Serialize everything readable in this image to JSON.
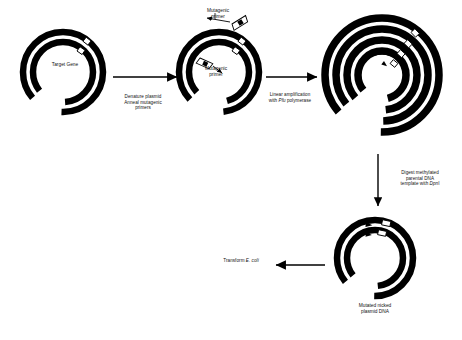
{
  "diagram": {
    "background_color": "#ffffff",
    "ink_color": "#000000",
    "width": 462,
    "height": 340
  },
  "steps": {
    "denature": "Denature plasmid\nAnneal mutagenic\nprimers",
    "amplify_pre": "Linear amplification\nwith ",
    "amplify_italic": "Pfu",
    "amplify_post": " polymerase",
    "digest_pre": "Digest methylated\nparental DNA\ntemplate with ",
    "digest_italic": "Dpn",
    "digest_post": "I",
    "transform_pre": "Transform ",
    "transform_italic": "E. coli"
  },
  "plasmids": {
    "stage1": {
      "name": "Parental plasmid with target gene",
      "label": "Target Gene",
      "rings": 2,
      "mutation_sites": 2
    },
    "stage2": {
      "name": "Denatured plasmid with annealed mutagenic primers",
      "label_top": "Mutagenic\nprimer",
      "label_inner": "Mutagenic\nprimer",
      "rings": 2,
      "primers": 2
    },
    "stage3": {
      "name": "Linear amplification product",
      "rings": 4,
      "mutation_sites": 4
    },
    "stage4": {
      "name": "Mutated nicked plasmid",
      "label": "Mutated nicked\nplasmid DNA",
      "rings": 2,
      "mutation_sites": 2
    }
  },
  "arrows": {
    "arrow1": "denature-anneal-arrow",
    "arrow2": "linear-amplification-arrow",
    "arrow3": "dpn1-digest-arrow",
    "arrow4": "transform-arrow"
  }
}
